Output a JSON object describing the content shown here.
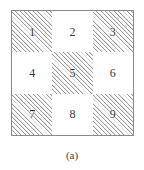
{
  "figure": {
    "caption": "(a)",
    "border_color": "#8a8a8a",
    "hatch_color": "#9b9b9b",
    "label_color": "#3b3b3b",
    "background_color": "#ffffff",
    "grid": {
      "rows": 3,
      "columns": 3,
      "cells": [
        {
          "label": "1",
          "row": 1,
          "column": 1,
          "shaded": true
        },
        {
          "label": "2",
          "row": 1,
          "column": 2,
          "shaded": false
        },
        {
          "label": "3",
          "row": 1,
          "column": 3,
          "shaded": true
        },
        {
          "label": "4",
          "row": 2,
          "column": 1,
          "shaded": false
        },
        {
          "label": "5",
          "row": 2,
          "column": 2,
          "shaded": true
        },
        {
          "label": "6",
          "row": 2,
          "column": 3,
          "shaded": false
        },
        {
          "label": "7",
          "row": 3,
          "column": 1,
          "shaded": true
        },
        {
          "label": "8",
          "row": 3,
          "column": 2,
          "shaded": false
        },
        {
          "label": "9",
          "row": 3,
          "column": 3,
          "shaded": true
        }
      ]
    }
  }
}
